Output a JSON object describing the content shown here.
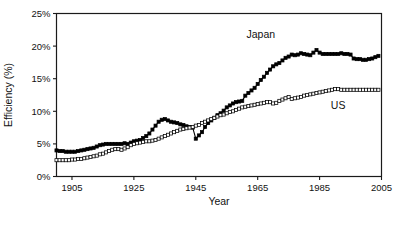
{
  "chart_data": {
    "type": "line",
    "title": "",
    "xlabel": "Year",
    "ylabel": "Efficiency (%)",
    "xlim": [
      1900,
      2005
    ],
    "ylim": [
      0,
      25
    ],
    "xticks": [
      1905,
      1925,
      1945,
      1965,
      1985,
      2005
    ],
    "xtick_labels": [
      "1905",
      "1925",
      "1945",
      "1965",
      "1985",
      "2005"
    ],
    "yticks": [
      0,
      5,
      10,
      15,
      20,
      25
    ],
    "ytick_labels": [
      "0%",
      "5%",
      "10%",
      "15%",
      "20%",
      "25%"
    ],
    "grid": false,
    "legend_position": "inline-annotation",
    "annotations": [
      {
        "text": "Japan",
        "x": 1966,
        "y": 21.2
      },
      {
        "text": "US",
        "x": 1991,
        "y": 10.4
      }
    ],
    "series": [
      {
        "name": "Japan",
        "marker": "filled-square",
        "marker_color": "#000000",
        "line_color": "#000000",
        "x": [
          1900,
          1901,
          1902,
          1903,
          1904,
          1905,
          1906,
          1907,
          1908,
          1909,
          1910,
          1911,
          1912,
          1913,
          1914,
          1915,
          1916,
          1917,
          1918,
          1919,
          1920,
          1921,
          1922,
          1923,
          1924,
          1925,
          1926,
          1927,
          1928,
          1929,
          1930,
          1931,
          1932,
          1933,
          1934,
          1935,
          1936,
          1937,
          1938,
          1939,
          1940,
          1941,
          1942,
          1943,
          1944,
          1945,
          1946,
          1947,
          1948,
          1949,
          1950,
          1951,
          1952,
          1953,
          1954,
          1955,
          1956,
          1957,
          1958,
          1959,
          1960,
          1961,
          1962,
          1963,
          1964,
          1965,
          1966,
          1967,
          1968,
          1969,
          1970,
          1971,
          1972,
          1973,
          1974,
          1975,
          1976,
          1977,
          1978,
          1979,
          1980,
          1981,
          1982,
          1983,
          1984,
          1985,
          1986,
          1987,
          1988,
          1989,
          1990,
          1991,
          1992,
          1993,
          1994,
          1995,
          1996,
          1997,
          1998,
          1999,
          2000,
          2001,
          2002,
          2003,
          2004
        ],
        "values": [
          4.0,
          3.9,
          3.9,
          3.8,
          3.8,
          3.8,
          3.8,
          3.9,
          4.0,
          4.1,
          4.2,
          4.3,
          4.4,
          4.6,
          4.8,
          4.9,
          5.0,
          5.0,
          5.0,
          5.0,
          5.0,
          5.0,
          5.1,
          5.0,
          5.2,
          5.4,
          5.5,
          5.6,
          5.9,
          6.2,
          6.6,
          7.2,
          7.8,
          8.4,
          8.7,
          8.8,
          8.6,
          8.4,
          8.3,
          8.2,
          8.0,
          7.9,
          7.7,
          7.6,
          7.5,
          5.8,
          6.3,
          6.8,
          7.6,
          8.2,
          8.6,
          9.0,
          9.4,
          9.7,
          10.1,
          10.6,
          10.9,
          11.2,
          11.4,
          11.5,
          11.6,
          12.4,
          12.8,
          13.2,
          13.6,
          14.2,
          14.8,
          15.3,
          15.9,
          16.4,
          16.9,
          17.2,
          17.4,
          17.8,
          18.2,
          18.4,
          18.7,
          18.6,
          18.7,
          18.9,
          18.8,
          18.7,
          18.6,
          19.0,
          19.4,
          19.0,
          18.8,
          18.8,
          18.8,
          18.8,
          18.8,
          18.8,
          18.9,
          18.8,
          18.8,
          18.7,
          18.1,
          18.0,
          18.0,
          17.9,
          17.9,
          18.0,
          18.1,
          18.3,
          18.5
        ]
      },
      {
        "name": "US",
        "marker": "open-square",
        "marker_color": "#ffffff",
        "line_color": "#000000",
        "x": [
          1900,
          1901,
          1902,
          1903,
          1904,
          1905,
          1906,
          1907,
          1908,
          1909,
          1910,
          1911,
          1912,
          1913,
          1914,
          1915,
          1916,
          1917,
          1918,
          1919,
          1920,
          1921,
          1922,
          1923,
          1924,
          1925,
          1926,
          1927,
          1928,
          1929,
          1930,
          1931,
          1932,
          1933,
          1934,
          1935,
          1936,
          1937,
          1938,
          1939,
          1940,
          1941,
          1942,
          1943,
          1944,
          1945,
          1946,
          1947,
          1948,
          1949,
          1950,
          1951,
          1952,
          1953,
          1954,
          1955,
          1956,
          1957,
          1958,
          1959,
          1960,
          1961,
          1962,
          1963,
          1964,
          1965,
          1966,
          1967,
          1968,
          1969,
          1970,
          1971,
          1972,
          1973,
          1974,
          1975,
          1976,
          1977,
          1978,
          1979,
          1980,
          1981,
          1982,
          1983,
          1984,
          1985,
          1986,
          1987,
          1988,
          1989,
          1990,
          1991,
          1992,
          1993,
          1994,
          1995,
          1996,
          1997,
          1998,
          1999,
          2000,
          2001,
          2002,
          2003,
          2004
        ],
        "values": [
          2.5,
          2.5,
          2.5,
          2.5,
          2.5,
          2.6,
          2.6,
          2.7,
          2.7,
          2.8,
          2.9,
          3.0,
          3.1,
          3.2,
          3.4,
          3.5,
          3.7,
          3.9,
          4.1,
          4.2,
          4.2,
          4.1,
          4.3,
          4.5,
          4.8,
          5.0,
          5.1,
          5.2,
          5.3,
          5.4,
          5.4,
          5.5,
          5.6,
          5.8,
          6.0,
          6.2,
          6.4,
          6.6,
          6.8,
          7.0,
          7.2,
          7.3,
          7.4,
          7.5,
          7.6,
          7.8,
          7.9,
          8.2,
          8.4,
          8.6,
          8.8,
          9.0,
          9.2,
          9.4,
          9.5,
          9.7,
          9.9,
          10.0,
          10.2,
          10.4,
          10.6,
          10.7,
          10.8,
          10.9,
          11.0,
          11.1,
          11.2,
          11.3,
          11.4,
          11.4,
          11.2,
          11.3,
          11.6,
          11.8,
          12.0,
          12.2,
          11.9,
          12.0,
          12.1,
          12.2,
          12.4,
          12.5,
          12.6,
          12.7,
          12.8,
          12.9,
          13.0,
          13.1,
          13.2,
          13.3,
          13.4,
          13.4,
          13.3,
          13.3,
          13.3,
          13.3,
          13.3,
          13.3,
          13.3,
          13.3,
          13.3,
          13.3,
          13.3,
          13.3,
          13.3
        ]
      }
    ]
  }
}
